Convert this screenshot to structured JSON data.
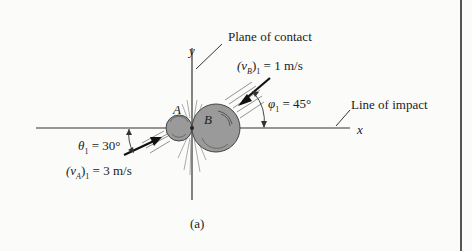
{
  "figure": {
    "caption": "(a)",
    "labels": {
      "plane_of_contact": "Plane of contact",
      "line_of_impact": "Line of impact",
      "axis_x": "x",
      "axis_y": "y",
      "ball_a": "A",
      "ball_b": "B",
      "vB_label": "(vB)1 = 1 m/s",
      "vB_sym": "(v",
      "vB_sub": "B",
      "vB_rest": ")",
      "vB_sub1": "1",
      "vB_value": " = 1 m/s",
      "vA_sym": "(v",
      "vA_sub": "A",
      "vA_rest": ")",
      "vA_sub1": "1",
      "vA_value": " = 3 m/s",
      "phi_sym": "φ",
      "phi_sub": "1",
      "phi_value": " = 45°",
      "theta_sym": "θ",
      "theta_sub": "1",
      "theta_value": " = 30°"
    },
    "colors": {
      "line": "#333333",
      "ball_fill": "#9a9a9a",
      "ball_stroke": "#444444",
      "background": "#fbfbfa"
    }
  }
}
